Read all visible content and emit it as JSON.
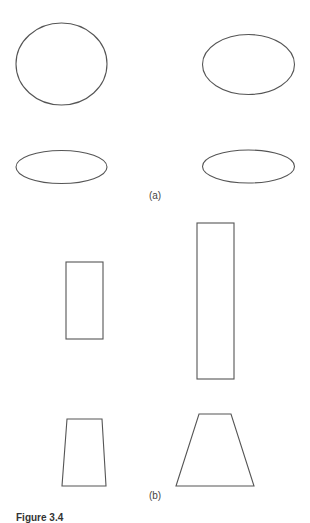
{
  "figure": {
    "panels": [
      {
        "id": "a",
        "label": "(a)",
        "shapes": [
          {
            "type": "ellipse",
            "name": "ellipse-top-left",
            "cx": 61.5,
            "cy": 64,
            "rx": 45.5,
            "ry": 41
          },
          {
            "type": "ellipse",
            "name": "ellipse-top-right",
            "cx": 248.5,
            "cy": 64.5,
            "rx": 46,
            "ry": 30
          },
          {
            "type": "ellipse",
            "name": "ellipse-bottom-left",
            "cx": 61.5,
            "cy": 167,
            "rx": 45.5,
            "ry": 16.5
          },
          {
            "type": "ellipse",
            "name": "ellipse-bottom-right",
            "cx": 248.5,
            "cy": 166.5,
            "rx": 46,
            "ry": 16.5
          }
        ]
      },
      {
        "id": "b",
        "label": "(b)",
        "shapes": [
          {
            "type": "rect",
            "name": "rectangle-short",
            "x": 66,
            "y": 262,
            "width": 37,
            "height": 77
          },
          {
            "type": "rect",
            "name": "rectangle-tall",
            "x": 197,
            "y": 223,
            "width": 37,
            "height": 156
          },
          {
            "type": "polygon",
            "name": "trapezoid-narrow",
            "points": "67,419 102,419 106,486 62,486"
          },
          {
            "type": "polygon",
            "name": "trapezoid-wide",
            "points": "199,414 231,414 254,486 176,486"
          }
        ]
      }
    ],
    "caption": "Figure 3.4"
  },
  "style": {
    "stroke_color": "#555555",
    "background": "#ffffff"
  }
}
